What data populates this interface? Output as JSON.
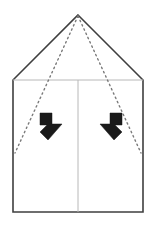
{
  "canvas": {
    "width": 155,
    "height": 226,
    "background": "#ffffff",
    "title": "Paper folding instruction diagram"
  },
  "colors": {
    "outline": "#3f3f3f",
    "crease": "#b8b8b8",
    "dotted": "#7a7a7a",
    "arrow": "#1a1a1a",
    "background": "#ffffff"
  },
  "shapes": {
    "outline": {
      "name": "house-pentagon-outline",
      "points": "78,15 143,80 143,212 13,212 13,80",
      "stroke_width": 1.6,
      "fill": "#ffffff"
    },
    "creases": [
      {
        "name": "horizontal-crease",
        "x1": 13,
        "y1": 80,
        "x2": 143,
        "y2": 80,
        "stroke_width": 1
      },
      {
        "name": "vertical-center-crease",
        "x1": 78,
        "y1": 80,
        "x2": 78,
        "y2": 212,
        "stroke_width": 1
      }
    ],
    "dotted_lines": [
      {
        "name": "dotted-fold-line-left",
        "x1": 78,
        "y1": 16,
        "x2": 15,
        "y2": 153,
        "stroke_width": 1.4,
        "dash": "1.5 3.2"
      },
      {
        "name": "dotted-fold-line-right",
        "x1": 78,
        "y1": 16,
        "x2": 141,
        "y2": 153,
        "stroke_width": 1.4,
        "dash": "1.5 3.2"
      }
    ],
    "arrows": [
      {
        "name": "fold-arrow-left",
        "direction": "down-right",
        "points": "40,113 52,113 52,124 62,124 48,140 40,132 47,125 40,125",
        "rotation": 0,
        "cx": 50,
        "cy": 126
      },
      {
        "name": "fold-arrow-right",
        "direction": "down-left",
        "points": "122,113 110,113 110,124 100,124 114,140 122,132 115,125 122,125",
        "rotation": 0,
        "cx": 111,
        "cy": 126
      }
    ]
  },
  "labels": {
    "alt_text": "Origami fold step: pentagon shaped paper with dotted fold guides from top apex and two black arrows indicating inward folds"
  }
}
